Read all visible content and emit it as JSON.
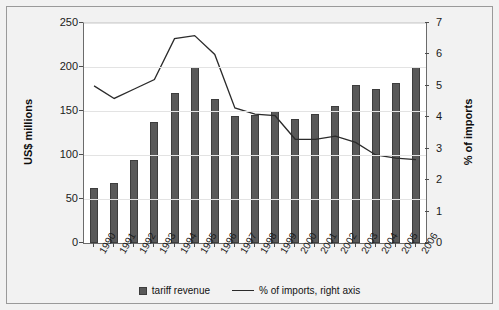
{
  "chart_data": {
    "type": "bar",
    "title": "",
    "subtitle": "",
    "categories": [
      "1990",
      "1991",
      "1992",
      "1993",
      "1994",
      "1995",
      "1996",
      "1997",
      "1998",
      "1999",
      "2000",
      "2001",
      "2002",
      "2003",
      "2004",
      "2005",
      "2006"
    ],
    "series": [
      {
        "name": "tariff revenue",
        "type": "bar",
        "axis": "left",
        "color": "#595959",
        "values": [
          62,
          68,
          94,
          137,
          171,
          200,
          164,
          144,
          146,
          150,
          141,
          147,
          156,
          179,
          175,
          182,
          200
        ]
      },
      {
        "name": "% of imports, right axis",
        "type": "line",
        "axis": "right",
        "color": "#2b2b2b",
        "values": [
          5.0,
          4.6,
          4.9,
          5.2,
          6.5,
          6.6,
          6.0,
          4.3,
          4.1,
          4.05,
          3.3,
          3.3,
          3.4,
          3.2,
          2.8,
          2.7,
          2.65
        ]
      }
    ],
    "xlabel": "",
    "ylabel": "US$ millions",
    "y2label": "% of imports",
    "ylim": [
      0,
      250
    ],
    "yticks": [
      0,
      50,
      100,
      150,
      200,
      250
    ],
    "y2lim": [
      0,
      7
    ],
    "y2ticks": [
      0,
      1,
      2,
      3,
      4,
      5,
      6,
      7
    ],
    "grid": true,
    "legend_position": "bottom"
  },
  "legend": {
    "bar_label": "tariff revenue",
    "line_label": "% of imports, right axis"
  }
}
